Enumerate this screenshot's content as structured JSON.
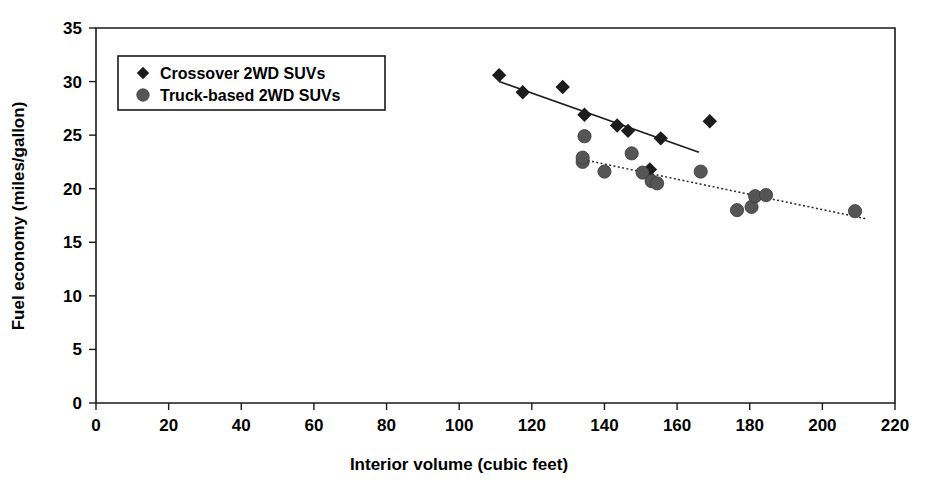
{
  "chart_data": {
    "type": "scatter",
    "title": "",
    "xlabel": "Interior volume (cubic feet)",
    "ylabel": "Fuel economy (miles/gallon)",
    "xlim": [
      0,
      220
    ],
    "ylim": [
      0,
      35
    ],
    "xticks": [
      0,
      20,
      40,
      60,
      80,
      100,
      120,
      140,
      160,
      180,
      200,
      220
    ],
    "yticks": [
      0,
      5,
      10,
      15,
      20,
      25,
      30,
      35
    ],
    "grid": false,
    "legend_position": "upper-left-inside",
    "series": [
      {
        "name": "Crossover 2WD SUVs",
        "marker": "diamond",
        "color": "#1c1c1c",
        "points": [
          [
            111.0,
            30.6
          ],
          [
            117.5,
            29.0
          ],
          [
            128.5,
            29.5
          ],
          [
            134.5,
            26.9
          ],
          [
            143.5,
            25.9
          ],
          [
            146.5,
            25.4
          ],
          [
            155.5,
            24.7
          ],
          [
            152.5,
            21.8
          ],
          [
            169.0,
            26.3
          ]
        ],
        "trendline": {
          "x0": 111.0,
          "y0": 30.0,
          "x1": 166.0,
          "y1": 23.4
        }
      },
      {
        "name": "Truck-based 2WD SUVs",
        "marker": "circle",
        "color": "#555555",
        "points": [
          [
            134.5,
            24.9
          ],
          [
            134.0,
            22.5
          ],
          [
            140.0,
            21.6
          ],
          [
            147.5,
            23.3
          ],
          [
            134.0,
            22.9
          ],
          [
            150.5,
            21.5
          ],
          [
            153.0,
            20.7
          ],
          [
            154.5,
            20.5
          ],
          [
            166.5,
            21.6
          ],
          [
            176.5,
            18.0
          ],
          [
            180.5,
            18.3
          ],
          [
            181.5,
            19.3
          ],
          [
            184.5,
            19.4
          ],
          [
            209.0,
            17.9
          ]
        ],
        "trendline": {
          "x0": 133.0,
          "y0": 22.8,
          "x1": 212.0,
          "y1": 17.2
        }
      }
    ]
  },
  "legend": {
    "entries": [
      {
        "label": "Crossover 2WD SUVs",
        "marker": "diamond"
      },
      {
        "label": "Truck-based 2WD SUVs",
        "marker": "circle"
      }
    ]
  },
  "axes": {
    "x_title": "Interior volume (cubic feet)",
    "y_title": "Fuel economy (miles/gallon)",
    "x_tick_labels": [
      "0",
      "20",
      "40",
      "60",
      "80",
      "100",
      "120",
      "140",
      "160",
      "180",
      "200",
      "220"
    ],
    "y_tick_labels": [
      "0",
      "5",
      "10",
      "15",
      "20",
      "25",
      "30",
      "35"
    ]
  },
  "colors": {
    "crossover_marker": "#1c1c1c",
    "truck_marker": "#555555",
    "frame": "#1a1a1a",
    "background": "#ffffff"
  }
}
